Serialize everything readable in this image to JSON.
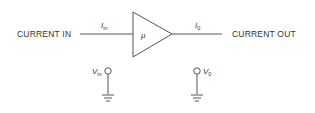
{
  "diagram": {
    "type": "amplifier-block",
    "input_label": "CURRENT IN",
    "output_label": "CURRENT OUT",
    "input_current": {
      "symbol": "I",
      "subscript": "in"
    },
    "output_current": {
      "symbol": "I",
      "subscript": "0"
    },
    "gain_symbol": "μ",
    "input_voltage": {
      "symbol": "V",
      "subscript": "in"
    },
    "output_voltage": {
      "symbol": "V",
      "subscript": "0"
    },
    "colors": {
      "stroke": "#555555",
      "text": "#333333",
      "background": "#ffffff"
    }
  }
}
